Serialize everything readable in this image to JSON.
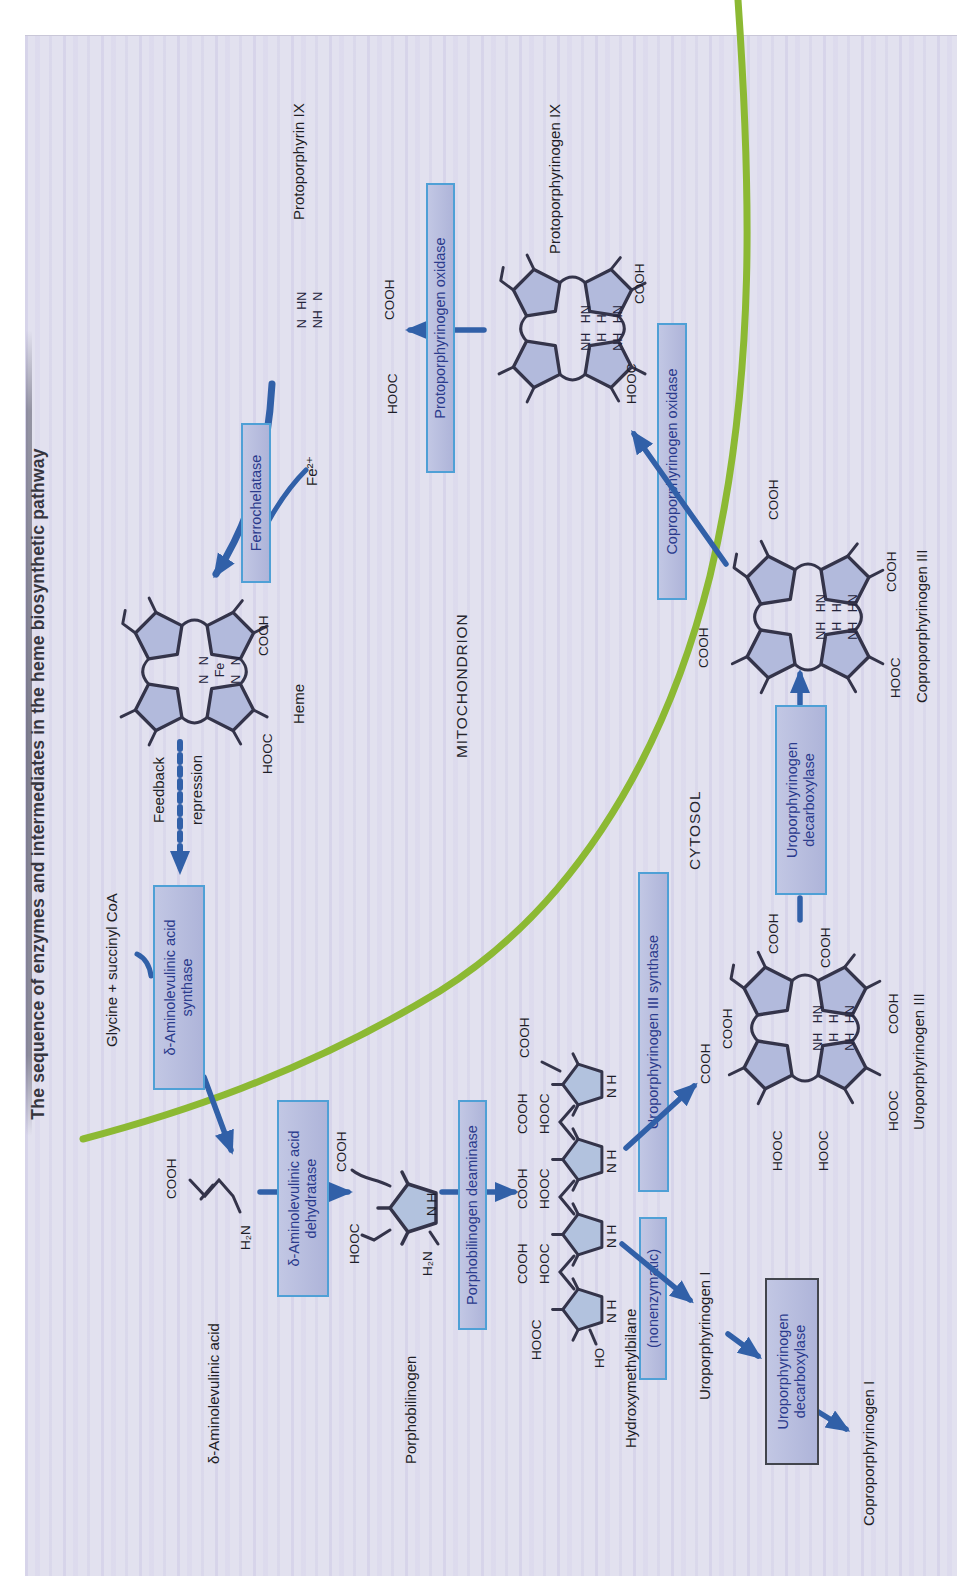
{
  "title": "The sequence of enzymes and intermediates in the heme biosynthetic pathway",
  "compartments": {
    "mitochondrion": "MITOCHONDRION",
    "cytosol": "CYTOSOL"
  },
  "inputs": {
    "substrates": "Glycine + succinyl CoA",
    "iron": "Fe²⁺"
  },
  "feedback": {
    "line1": "Feedback",
    "line2": "repression"
  },
  "enzymes": {
    "ala_synthase": [
      "δ-Aminolevulinic acid",
      "synthase"
    ],
    "ala_dehydratase": [
      "δ-Aminolevulinic acid",
      "dehydratase"
    ],
    "pbg_deaminase": "Porphobilinogen deaminase",
    "uro3_synthase": "Uroporphyrinogen III synthase",
    "nonenzymatic": "(nonenzymatic)",
    "uro_decarboxylase_3": [
      "Uroporphyrinogen",
      "decarboxylase"
    ],
    "uro_decarboxylase_1": [
      "Uroporphyrinogen",
      "decarboxylase"
    ],
    "copro_oxidase": "Coproporphyrinogen oxidase",
    "proto_oxidase": "Protoporphyrinogen oxidase",
    "ferrochelatase": "Ferrochelatase"
  },
  "molecules": {
    "ala": {
      "name": "δ-Aminolevulinic acid"
    },
    "pbg": {
      "name": "Porphobilinogen"
    },
    "hmb": {
      "name": "Hydroxymethylbilane"
    },
    "uro3": {
      "name": "Uroporphyrinogen III",
      "center": [
        "NH HN",
        "H H",
        "NH HN"
      ]
    },
    "uro1": {
      "name": "Uroporphyrinogen I"
    },
    "copro1": {
      "name": "Coproporphyrinogen I"
    },
    "copro3": {
      "name": "Coproporphyrinogen III",
      "center": [
        "NH HN",
        "H H",
        "NH HN"
      ]
    },
    "protogen9": {
      "name": "Protoporphyrinogen IX",
      "center": [
        "NH HN",
        "H H",
        "NH HN"
      ]
    },
    "proto9": {
      "name": "Protoporphyrin IX",
      "center": [
        "N HN",
        "NH N"
      ]
    },
    "heme": {
      "name": "Heme",
      "center": [
        "N N",
        "Fe",
        "N N"
      ]
    }
  },
  "chem": {
    "cooh": "COOH",
    "hooc": "HOOC",
    "ho": "HO",
    "h2n": "H₂N",
    "nh_pair": "N H"
  },
  "colors": {
    "page_background": "#e2e1ef",
    "enzyme_box_fill": "#b5bbdd",
    "enzyme_box_border": "#4fa0d6",
    "enzyme_box_border_dark": "#42454d",
    "enzyme_text": "#2a3a8c",
    "arrow_blue": "#3160a8",
    "membrane_green": "#8cb933",
    "structure_stroke": "#34344a",
    "ring_fill": "#b2badc",
    "label_text": "#1e1e26"
  }
}
